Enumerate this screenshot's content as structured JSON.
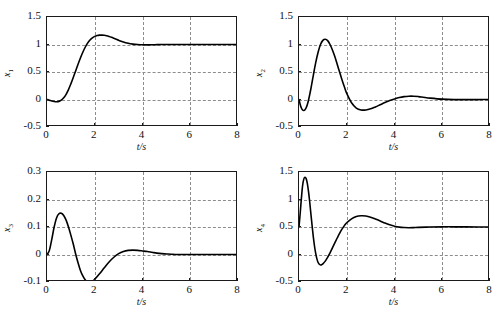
{
  "figure": {
    "background_color": "#ffffff",
    "curve_color": "#000000",
    "grid_color": "#8c8c8c",
    "axis_color": "#1a1a1a"
  },
  "chart_data": [
    {
      "type": "line",
      "id": "subplot-x1",
      "position": "top-left",
      "title": "",
      "xlabel": "t/s",
      "ylabel": "x",
      "ylabel_sub": "1",
      "xlim": [
        0,
        8
      ],
      "ylim": [
        -0.5,
        1.5
      ],
      "xticks": [
        0,
        2,
        4,
        6,
        8
      ],
      "xtick_labels": [
        "0",
        "2",
        "4",
        "6",
        "8"
      ],
      "yticks": [
        -0.5,
        0,
        0.5,
        1,
        1.5
      ],
      "ytick_labels": [
        "-0.5",
        "0",
        "0.5",
        "1",
        "1.5"
      ],
      "grid": true,
      "grid_x": [
        2,
        4,
        6
      ],
      "grid_y": [
        0,
        0.5,
        1
      ],
      "series": [
        {
          "name": "x1",
          "x": [
            0,
            0.1,
            0.2,
            0.3,
            0.4,
            0.5,
            0.6,
            0.7,
            0.8,
            0.9,
            1.0,
            1.1,
            1.2,
            1.3,
            1.4,
            1.5,
            1.6,
            1.7,
            1.8,
            1.9,
            2.0,
            2.1,
            2.2,
            2.3,
            2.4,
            2.5,
            2.6,
            2.7,
            2.8,
            2.9,
            3.0,
            3.2,
            3.4,
            3.6,
            3.8,
            4.0,
            4.2,
            4.4,
            4.6,
            4.8,
            5.0,
            5.5,
            6.0,
            6.5,
            7.0,
            7.5,
            8.0
          ],
          "y": [
            0,
            -0.012,
            -0.026,
            -0.036,
            -0.04,
            -0.034,
            -0.012,
            0.03,
            0.095,
            0.18,
            0.285,
            0.4,
            0.52,
            0.64,
            0.755,
            0.86,
            0.95,
            1.025,
            1.082,
            1.122,
            1.148,
            1.163,
            1.17,
            1.171,
            1.167,
            1.158,
            1.145,
            1.13,
            1.113,
            1.095,
            1.077,
            1.045,
            1.022,
            1.007,
            0.999,
            0.995,
            0.994,
            0.995,
            0.997,
            0.999,
            1.0,
            1.0,
            1.0,
            1.0,
            1.0,
            1.0,
            1.0
          ]
        }
      ]
    },
    {
      "type": "line",
      "id": "subplot-x2",
      "position": "top-right",
      "title": "",
      "xlabel": "t/s",
      "ylabel": "x",
      "ylabel_sub": "2",
      "xlim": [
        0,
        8
      ],
      "ylim": [
        -0.5,
        1.5
      ],
      "xticks": [
        0,
        2,
        4,
        6,
        8
      ],
      "xtick_labels": [
        "0",
        "2",
        "4",
        "6",
        "8"
      ],
      "yticks": [
        -0.5,
        0,
        0.5,
        1,
        1.5
      ],
      "ytick_labels": [
        "-0.5",
        "0",
        "0.5",
        "1",
        "1.5"
      ],
      "grid": true,
      "grid_x": [
        2,
        4,
        6
      ],
      "grid_y": [
        0,
        0.5,
        1
      ],
      "series": [
        {
          "name": "x2",
          "x": [
            0,
            0.05,
            0.1,
            0.15,
            0.2,
            0.25,
            0.3,
            0.35,
            0.4,
            0.5,
            0.6,
            0.7,
            0.8,
            0.9,
            1.0,
            1.1,
            1.2,
            1.3,
            1.4,
            1.5,
            1.6,
            1.7,
            1.8,
            1.9,
            2.0,
            2.2,
            2.4,
            2.6,
            2.8,
            3.0,
            3.2,
            3.4,
            3.6,
            3.8,
            4.0,
            4.2,
            4.4,
            4.6,
            4.8,
            5.0,
            5.2,
            5.5,
            6.0,
            6.5,
            7.0,
            7.5,
            8.0
          ],
          "y": [
            0,
            -0.09,
            -0.155,
            -0.19,
            -0.2,
            -0.185,
            -0.15,
            -0.09,
            -0.01,
            0.2,
            0.44,
            0.67,
            0.86,
            1.0,
            1.075,
            1.095,
            1.07,
            1.0,
            0.9,
            0.78,
            0.64,
            0.5,
            0.36,
            0.23,
            0.11,
            -0.06,
            -0.155,
            -0.19,
            -0.19,
            -0.17,
            -0.135,
            -0.095,
            -0.055,
            -0.02,
            0.01,
            0.035,
            0.052,
            0.06,
            0.06,
            0.053,
            0.042,
            0.025,
            0.006,
            -0.002,
            -0.003,
            -0.002,
            0
          ]
        }
      ]
    },
    {
      "type": "line",
      "id": "subplot-x3",
      "position": "bottom-left",
      "title": "",
      "xlabel": "t/s",
      "ylabel": "x",
      "ylabel_sub": "3",
      "xlim": [
        0,
        8
      ],
      "ylim": [
        -0.1,
        0.3
      ],
      "xticks": [
        0,
        2,
        4,
        6,
        8
      ],
      "xtick_labels": [
        "0",
        "2",
        "4",
        "6",
        "8"
      ],
      "yticks": [
        -0.1,
        0,
        0.1,
        0.2,
        0.3
      ],
      "ytick_labels": [
        "-0.1",
        "0",
        "0.1",
        "0.2",
        "0.3"
      ],
      "grid": true,
      "grid_x": [
        2,
        4,
        6
      ],
      "grid_y": [
        0,
        0.1,
        0.2
      ],
      "series": [
        {
          "name": "x3",
          "x": [
            0,
            0.1,
            0.2,
            0.3,
            0.4,
            0.5,
            0.6,
            0.7,
            0.8,
            0.9,
            1.0,
            1.1,
            1.2,
            1.3,
            1.4,
            1.5,
            1.6,
            1.7,
            1.8,
            1.9,
            2.0,
            2.2,
            2.4,
            2.6,
            2.8,
            3.0,
            3.2,
            3.4,
            3.6,
            3.8,
            4.0,
            4.2,
            4.4,
            4.6,
            4.8,
            5.0,
            5.2,
            5.5,
            6.0,
            6.5,
            7.0,
            7.5,
            8.0
          ],
          "y": [
            0,
            0.015,
            0.055,
            0.1,
            0.133,
            0.148,
            0.15,
            0.142,
            0.125,
            0.1,
            0.07,
            0.038,
            0.002,
            -0.03,
            -0.058,
            -0.078,
            -0.092,
            -0.099,
            -0.1,
            -0.097,
            -0.09,
            -0.07,
            -0.048,
            -0.027,
            -0.01,
            0.003,
            0.011,
            0.015,
            0.016,
            0.015,
            0.013,
            0.011,
            0.008,
            0.005,
            0.003,
            0.002,
            0.001,
            0,
            0,
            0,
            0,
            0,
            0
          ]
        }
      ]
    },
    {
      "type": "line",
      "id": "subplot-x4",
      "position": "bottom-right",
      "title": "",
      "xlabel": "t/s",
      "ylabel": "x",
      "ylabel_sub": "4",
      "xlim": [
        0,
        8
      ],
      "ylim": [
        -0.5,
        1.5
      ],
      "xticks": [
        0,
        2,
        4,
        6,
        8
      ],
      "xtick_labels": [
        "0",
        "2",
        "4",
        "6",
        "8"
      ],
      "yticks": [
        -0.5,
        0,
        0.5,
        1,
        1.5
      ],
      "ytick_labels": [
        "-0.5",
        "0",
        "0.5",
        "1",
        "1.5"
      ],
      "grid": true,
      "grid_x": [
        2,
        4,
        6
      ],
      "grid_y": [
        0,
        0.5,
        1
      ],
      "series": [
        {
          "name": "x4",
          "x": [
            0,
            0.05,
            0.1,
            0.15,
            0.2,
            0.25,
            0.3,
            0.35,
            0.4,
            0.45,
            0.5,
            0.55,
            0.6,
            0.65,
            0.7,
            0.75,
            0.8,
            0.85,
            0.9,
            0.95,
            1.0,
            1.1,
            1.2,
            1.3,
            1.4,
            1.5,
            1.6,
            1.7,
            1.8,
            1.9,
            2.0,
            2.2,
            2.4,
            2.6,
            2.8,
            3.0,
            3.2,
            3.4,
            3.6,
            3.8,
            4.0,
            4.2,
            4.4,
            4.6,
            4.8,
            5.0,
            5.5,
            6.0,
            6.5,
            7.0,
            7.5,
            8.0
          ],
          "y": [
            0.5,
            0.75,
            1.02,
            1.25,
            1.37,
            1.405,
            1.38,
            1.29,
            1.14,
            0.95,
            0.73,
            0.52,
            0.32,
            0.15,
            0.02,
            -0.08,
            -0.145,
            -0.178,
            -0.19,
            -0.185,
            -0.17,
            -0.12,
            -0.05,
            0.03,
            0.12,
            0.21,
            0.3,
            0.385,
            0.46,
            0.525,
            0.578,
            0.648,
            0.69,
            0.705,
            0.7,
            0.678,
            0.645,
            0.61,
            0.572,
            0.54,
            0.515,
            0.498,
            0.49,
            0.487,
            0.489,
            0.493,
            0.5,
            0.503,
            0.503,
            0.502,
            0.501,
            0.5
          ]
        }
      ]
    }
  ]
}
